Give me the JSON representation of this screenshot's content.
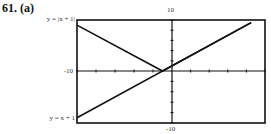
{
  "problem": {
    "number": "61.",
    "part": "(a)"
  },
  "chart_data": {
    "type": "line",
    "title": "",
    "xlabel": "",
    "ylabel": "",
    "xlim": [
      -10,
      10
    ],
    "ylim": [
      -10,
      10
    ],
    "tick_labels": {
      "top": "10",
      "left": "-10",
      "bottom": "-10"
    },
    "series": [
      {
        "name": "y = |x + 1|",
        "x": [
          -10,
          -1,
          8.5
        ],
        "y": [
          9,
          0,
          9.5
        ]
      },
      {
        "name": "y = x + 1",
        "x": [
          -10,
          8.5
        ],
        "y": [
          -9,
          9.5
        ]
      }
    ],
    "grid": false,
    "legend_position": "left-of-plot labels"
  },
  "labels": {
    "abs": "y = |x + 1|",
    "lin": "y = x + 1"
  }
}
